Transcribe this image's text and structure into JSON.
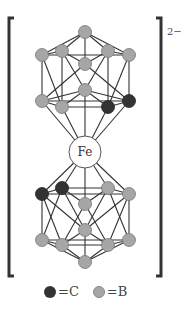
{
  "diagram": {
    "center_atom": "Fe",
    "charge": "2−",
    "colors": {
      "carbon": "#333333",
      "boron": "#a6a6a6",
      "bond": "#333333",
      "bracket": "#333333"
    },
    "top_cage": {
      "nodes": [
        {
          "id": "t0",
          "x": 85,
          "y": 32,
          "type": "B"
        },
        {
          "id": "t1",
          "x": 42,
          "y": 55,
          "type": "B"
        },
        {
          "id": "t2",
          "x": 62,
          "y": 51,
          "type": "B"
        },
        {
          "id": "t3",
          "x": 108,
          "y": 51,
          "type": "B"
        },
        {
          "id": "t4",
          "x": 129,
          "y": 55,
          "type": "B"
        },
        {
          "id": "t5",
          "x": 85,
          "y": 64,
          "type": "B"
        },
        {
          "id": "t6",
          "x": 85,
          "y": 90,
          "type": "B"
        },
        {
          "id": "t7",
          "x": 42,
          "y": 101,
          "type": "B"
        },
        {
          "id": "t8",
          "x": 62,
          "y": 107,
          "type": "B"
        },
        {
          "id": "t9",
          "x": 108,
          "y": 107,
          "type": "C"
        },
        {
          "id": "t10",
          "x": 129,
          "y": 101,
          "type": "C"
        }
      ]
    },
    "bottom_cage": {
      "nodes": [
        {
          "id": "b1",
          "x": 42,
          "y": 194,
          "type": "C"
        },
        {
          "id": "b2",
          "x": 62,
          "y": 188,
          "type": "C"
        },
        {
          "id": "b3",
          "x": 108,
          "y": 188,
          "type": "B"
        },
        {
          "id": "b4",
          "x": 129,
          "y": 194,
          "type": "B"
        },
        {
          "id": "b5",
          "x": 85,
          "y": 204,
          "type": "B"
        },
        {
          "id": "b6",
          "x": 85,
          "y": 230,
          "type": "B"
        },
        {
          "id": "b7",
          "x": 42,
          "y": 240,
          "type": "B"
        },
        {
          "id": "b8",
          "x": 62,
          "y": 245,
          "type": "B"
        },
        {
          "id": "b9",
          "x": 108,
          "y": 245,
          "type": "B"
        },
        {
          "id": "b10",
          "x": 129,
          "y": 240,
          "type": "B"
        },
        {
          "id": "b0",
          "x": 85,
          "y": 262,
          "type": "B"
        }
      ]
    },
    "fe": {
      "x": 85,
      "y": 152,
      "r": 16
    }
  },
  "legend": {
    "items": [
      {
        "label": "=C",
        "color": "#333333"
      },
      {
        "label": "=B",
        "color": "#a6a6a6"
      }
    ]
  }
}
